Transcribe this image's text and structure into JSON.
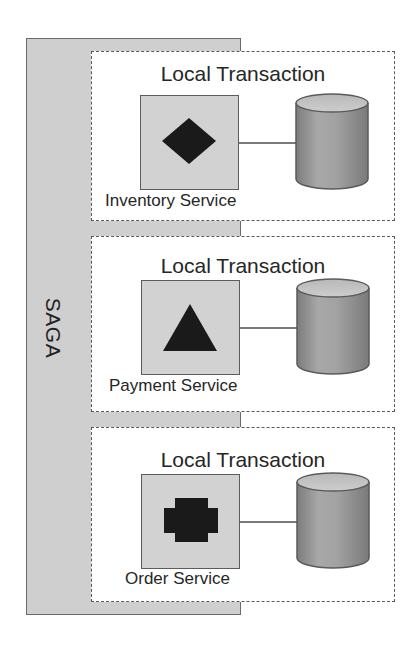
{
  "diagram": {
    "saga_label": "SAGA",
    "colors": {
      "saga_fill": "#cfcfcf",
      "service_fill": "#d2d2d2",
      "glyph": "#1a1a1a",
      "db_body": "#9a9a9a",
      "db_top": "#c4c4c4",
      "border": "#5a5a5a"
    },
    "transactions": [
      {
        "title": "Local Transaction",
        "service": "Inventory Service",
        "glyph": "diamond-icon",
        "database": "database-icon"
      },
      {
        "title": "Local Transaction",
        "service": "Payment Service",
        "glyph": "triangle-icon",
        "database": "database-icon"
      },
      {
        "title": "Local Transaction",
        "service": "Order Service",
        "glyph": "cross-icon",
        "database": "database-icon"
      }
    ]
  }
}
